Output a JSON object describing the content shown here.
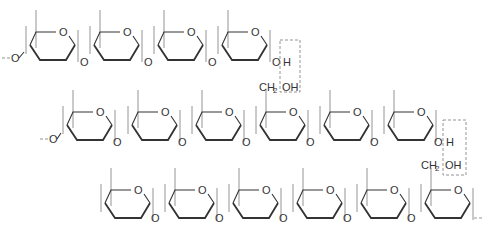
{
  "diagram": {
    "type": "glycogen-branch-structure",
    "colors": {
      "line": "#333333",
      "dashed_box": "#888888",
      "background": "#ffffff"
    },
    "labels": {
      "ring_oxygen": "O",
      "linkage_oxygen": "O",
      "hydrogen": "H",
      "hydroxyl": "OH",
      "ch2oh_prefix": "CH",
      "ch2oh_sub": "2",
      "ch2oh_suffix": "OH",
      "chain_start": "--O",
      "chain_end": "--"
    },
    "chains": [
      {
        "name": "chain-1",
        "ring_count": 4,
        "ends_with": "OH-branch-point"
      },
      {
        "name": "chain-2",
        "ring_count": 6,
        "branch_ch2oh_ring": 4,
        "ends_with": "OH-branch-point"
      },
      {
        "name": "chain-3",
        "ring_count": 6,
        "branch_ch2oh_ring": 6,
        "ends_with": "continuation"
      }
    ],
    "branch_boxes": [
      {
        "top_label": "H",
        "bottom_label": "CH2OH"
      },
      {
        "top_label": "H",
        "bottom_label": "CH2OH"
      }
    ]
  }
}
